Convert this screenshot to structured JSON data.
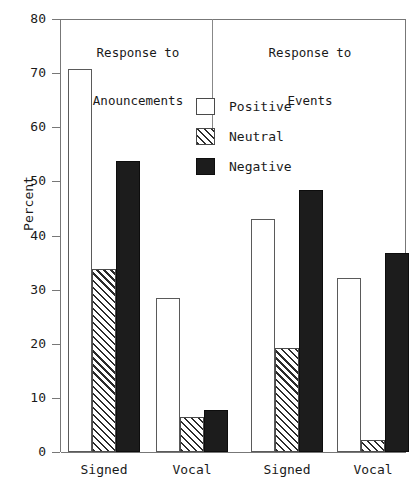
{
  "chart_data": {
    "type": "bar",
    "title": "",
    "xlabel": "",
    "ylabel": "Percent",
    "ylim": [
      0,
      80
    ],
    "ytick_labels": [
      "0",
      "10",
      "20",
      "30",
      "40",
      "50",
      "60",
      "70",
      "80"
    ],
    "ytick_values": [
      0,
      10,
      20,
      30,
      40,
      50,
      60,
      70,
      80
    ],
    "grid": false,
    "legend_position": "upper-center",
    "panels": [
      {
        "title": "Response to\nAnouncements",
        "title_line1": "Response to",
        "title_line2": "Anouncements",
        "categories": [
          "Signed",
          "Vocal"
        ],
        "series": [
          {
            "name": "Positive",
            "values": [
              70.7,
              28.5
            ]
          },
          {
            "name": "Neutral",
            "values": [
              33.8,
              6.4
            ]
          },
          {
            "name": "Negative",
            "values": [
              53.8,
              7.7
            ]
          }
        ]
      },
      {
        "title": "Response to\nEvents",
        "title_line1": "Response to",
        "title_line2": "Events",
        "categories": [
          "Signed",
          "Vocal"
        ],
        "series": [
          {
            "name": "Positive",
            "values": [
              43.1,
              32.2
            ]
          },
          {
            "name": "Neutral",
            "values": [
              19.2,
              2.2
            ]
          },
          {
            "name": "Negative",
            "values": [
              48.5,
              36.8
            ]
          }
        ]
      }
    ],
    "legend": [
      {
        "label": "Positive",
        "style": "positive",
        "color": "#ffffff"
      },
      {
        "label": "Neutral",
        "style": "neutral",
        "color": "#808080"
      },
      {
        "label": "Negative",
        "style": "negative",
        "color": "#1c1c1c"
      }
    ],
    "axis_color": "#777777"
  }
}
